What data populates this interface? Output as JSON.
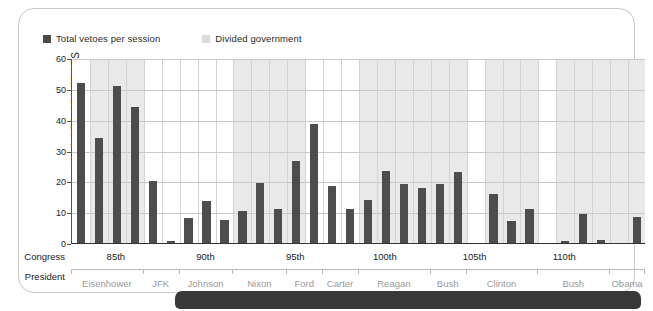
{
  "legend": {
    "series_label": "Total vetoes per session",
    "band_label": "Divided government",
    "series_color": "#4d4d4d",
    "band_color": "#e9e9e9"
  },
  "axes": {
    "y_title": "NUMBER OF VETOES",
    "y_ticks": [
      "0",
      "10",
      "20",
      "30",
      "40",
      "50",
      "60"
    ],
    "congress_row_label": "Congress",
    "president_row_label": "President"
  },
  "chart_data": {
    "type": "bar",
    "title": "",
    "xlabel": "Congress",
    "ylabel": "NUMBER OF VETOES",
    "ylim": [
      0,
      60
    ],
    "grid": true,
    "legend_position": "top-left",
    "series": [
      {
        "name": "Total vetoes per session",
        "color": "#4d4d4d",
        "values": [
          52,
          34,
          51,
          44,
          20,
          0.5,
          8,
          13.5,
          7.5,
          10.5,
          19.5,
          11,
          26.5,
          38.5,
          18.5,
          11,
          14,
          23.5,
          19,
          18,
          19,
          23,
          0,
          16,
          7,
          11,
          0,
          0.5,
          9.5,
          1,
          0,
          8.5
        ]
      }
    ],
    "categories": [
      "83rd",
      "84th",
      "85th",
      "86th",
      "87th",
      "88th",
      "89th",
      "90th",
      "91st",
      "92nd",
      "93rd",
      "94th",
      "95th",
      "96th",
      "97th",
      "98th",
      "99th",
      "100th",
      "101st",
      "102nd",
      "103rd",
      "104th",
      "105th",
      "106th",
      "107th",
      "108th",
      "109th",
      "110th",
      "111th",
      "112th",
      "113th",
      "114th"
    ],
    "congress_ticks": [
      {
        "label": "85th",
        "index": 2
      },
      {
        "label": "90th",
        "index": 7
      },
      {
        "label": "95th",
        "index": 12
      },
      {
        "label": "100th",
        "index": 17
      },
      {
        "label": "105th",
        "index": 22
      },
      {
        "label": "110th",
        "index": 27
      }
    ],
    "presidents": [
      {
        "name": "Eisenhower",
        "start": 0,
        "end": 4
      },
      {
        "name": "JFK",
        "start": 4,
        "end": 6
      },
      {
        "name": "Johnson",
        "start": 6,
        "end": 9
      },
      {
        "name": "Nixon",
        "start": 9,
        "end": 12
      },
      {
        "name": "Ford",
        "start": 12,
        "end": 14
      },
      {
        "name": "Carter",
        "start": 14,
        "end": 16
      },
      {
        "name": "Reagan",
        "start": 16,
        "end": 20
      },
      {
        "name": "Bush",
        "start": 20,
        "end": 22
      },
      {
        "name": "Clinton",
        "start": 22,
        "end": 26
      },
      {
        "name": "Bush",
        "start": 26,
        "end": 30
      },
      {
        "name": "Obama",
        "start": 30,
        "end": 32
      }
    ],
    "divided_government_bands": [
      {
        "start": 1,
        "end": 4
      },
      {
        "start": 9,
        "end": 13
      },
      {
        "start": 16,
        "end": 22
      },
      {
        "start": 23,
        "end": 26
      },
      {
        "start": 27,
        "end": 30
      },
      {
        "start": 30,
        "end": 32
      }
    ]
  }
}
